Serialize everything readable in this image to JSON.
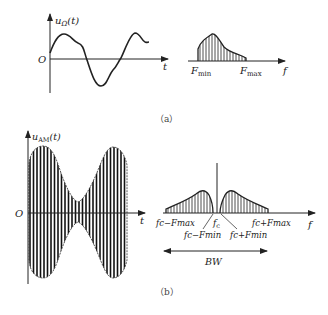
{
  "figure_a": {
    "caption": "（a）",
    "time_plot": {
      "y_label_main": "u",
      "y_label_sub": "Ω",
      "y_label_arg": "(t)",
      "origin_label": "O",
      "x_label": "t"
    },
    "spectrum": {
      "x_label": "f",
      "f_min_main": "F",
      "f_min_sub": "min",
      "f_max_main": "F",
      "f_max_sub": "max"
    }
  },
  "figure_b": {
    "caption": "（b）",
    "time_plot": {
      "y_label_main": "u",
      "y_label_sub": "AM",
      "y_label_arg": "(t)",
      "origin_label": "O",
      "x_label": "t"
    },
    "spectrum": {
      "x_label": "f",
      "carrier": "f",
      "carrier_sub": "c",
      "lower_max": "fc−Fmax",
      "lower_min": "fc−Fmin",
      "upper_min": "fc+Fmin",
      "upper_max": "fc+Fmax",
      "bandwidth_label": "BW"
    }
  },
  "colors": {
    "line": "#222222",
    "background": "#ffffff"
  }
}
